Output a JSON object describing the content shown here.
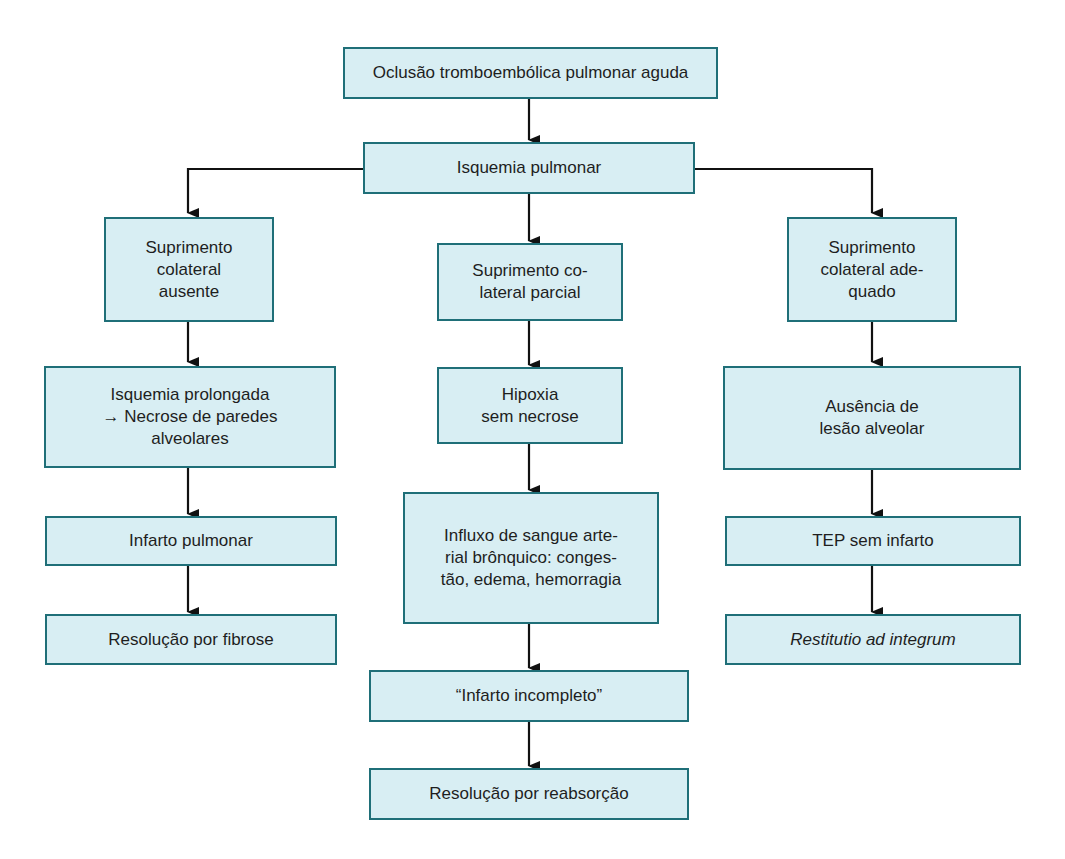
{
  "diagram": {
    "root": {
      "label": "Oclusão tromboembólica pulmonar aguda"
    },
    "level2": {
      "label": "Isquemia pulmonar"
    },
    "branches": [
      {
        "name": "absent",
        "steps": [
          {
            "label": "Suprimento\ncolateral\nausente"
          },
          {
            "label": "Isquemia prolongada\n→ Necrose de paredes\nalveolares"
          },
          {
            "label": "Infarto pulmonar"
          },
          {
            "label": "Resolução por fibrose"
          }
        ]
      },
      {
        "name": "partial",
        "steps": [
          {
            "label": "Suprimento co-\nlateral parcial"
          },
          {
            "label": "Hipoxia\nsem necrose"
          },
          {
            "label": "Influxo de sangue arte-\nrial brônquico: conges-\ntão, edema, hemorragia"
          },
          {
            "label": "“Infarto incompleto”"
          },
          {
            "label": "Resolução por reabsorção"
          }
        ]
      },
      {
        "name": "adequate",
        "steps": [
          {
            "label": "Suprimento\ncolateral ade-\nquado"
          },
          {
            "label": "Ausência de\nlesão alveolar"
          },
          {
            "label": "TEP sem infarto"
          },
          {
            "label": "Restitutio ad integrum"
          }
        ]
      }
    ],
    "colors": {
      "box_fill": "#d8eef3",
      "box_border": "#1f6f78",
      "arrow": "#111111"
    }
  }
}
